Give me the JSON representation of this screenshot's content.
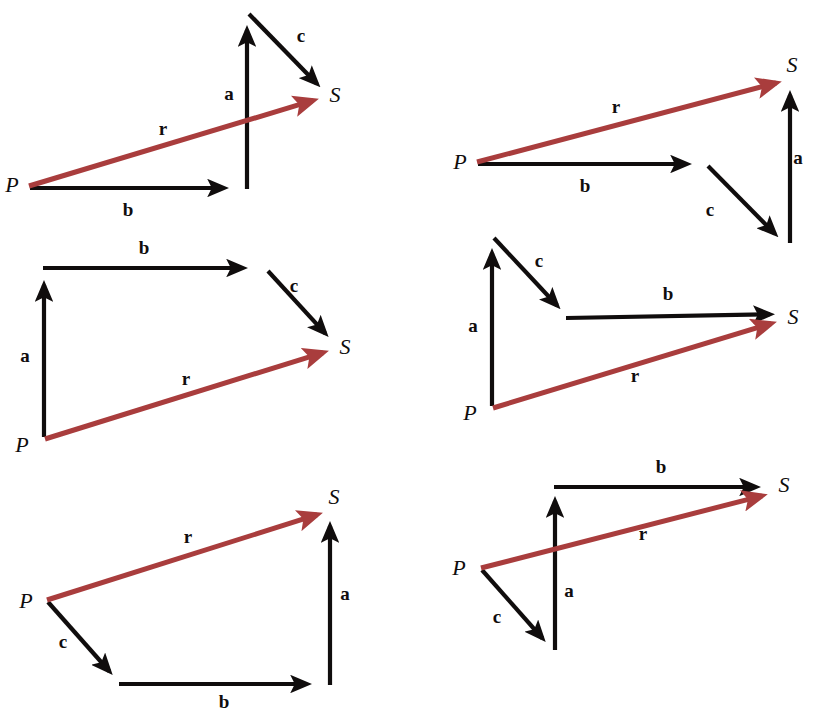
{
  "figure": {
    "width": 814,
    "height": 713,
    "background_color": "#ffffff",
    "component_vector_color": "#100d0d",
    "resultant_vector_color": "#a93d3d",
    "labels": {
      "a": "a",
      "b": "b",
      "c": "c",
      "r": "r",
      "P": "P",
      "S": "S"
    }
  },
  "panels": [
    {
      "id": "panel-1",
      "order": "b, a, c",
      "origin_label": "P",
      "terminus_label": "S",
      "resultant_label": "r",
      "arrows": [
        {
          "name": "vector-b",
          "label": "b",
          "color": "#100d0d",
          "x1": 30,
          "y1": 188,
          "x2": 237,
          "y2": 188,
          "label_x": 128,
          "label_y": 216
        },
        {
          "name": "vector-a",
          "label": "a",
          "color": "#100d0d",
          "x1": 247,
          "y1": 189,
          "x2": 247,
          "y2": 17,
          "label_x": 229,
          "label_y": 100
        },
        {
          "name": "vector-c",
          "label": "c",
          "color": "#100d0d",
          "x1": 249,
          "y1": 14,
          "x2": 326,
          "y2": 93,
          "label_x": 301,
          "label_y": 42
        },
        {
          "name": "vector-r",
          "label": "r",
          "color": "#a93d3d",
          "x1": 29,
          "y1": 186,
          "x2": 328,
          "y2": 96,
          "label_x": 163,
          "label_y": 135
        }
      ],
      "points": [
        {
          "name": "point-p",
          "label": "P",
          "x": 12,
          "y": 192
        },
        {
          "name": "point-s",
          "label": "S",
          "x": 335,
          "y": 102
        }
      ]
    },
    {
      "id": "panel-2",
      "order": "b, c, a",
      "origin_label": "P",
      "terminus_label": "S",
      "resultant_label": "r",
      "arrows": [
        {
          "name": "vector-b",
          "label": "b",
          "color": "#100d0d",
          "x1": 478,
          "y1": 164,
          "x2": 700,
          "y2": 164,
          "label_x": 585,
          "label_y": 192
        },
        {
          "name": "vector-c",
          "label": "c",
          "color": "#100d0d",
          "x1": 708,
          "y1": 166,
          "x2": 784,
          "y2": 243,
          "label_x": 710,
          "label_y": 216
        },
        {
          "name": "vector-a",
          "label": "a",
          "color": "#100d0d",
          "x1": 790,
          "y1": 243,
          "x2": 790,
          "y2": 82,
          "label_x": 798,
          "label_y": 164
        },
        {
          "name": "vector-r",
          "label": "r",
          "color": "#a93d3d",
          "x1": 477,
          "y1": 162,
          "x2": 791,
          "y2": 79,
          "label_x": 616,
          "label_y": 113
        }
      ],
      "points": [
        {
          "name": "point-p",
          "label": "P",
          "x": 460,
          "y": 169
        },
        {
          "name": "point-s",
          "label": "S",
          "x": 792,
          "y": 72
        }
      ]
    },
    {
      "id": "panel-3",
      "order": "a, b, c",
      "origin_label": "P",
      "terminus_label": "S",
      "resultant_label": "r",
      "arrows": [
        {
          "name": "vector-a",
          "label": "a",
          "color": "#100d0d",
          "x1": 44,
          "y1": 437,
          "x2": 44,
          "y2": 272,
          "label_x": 25,
          "label_y": 362
        },
        {
          "name": "vector-b",
          "label": "b",
          "color": "#100d0d",
          "x1": 43,
          "y1": 268,
          "x2": 256,
          "y2": 268,
          "label_x": 144,
          "label_y": 254
        },
        {
          "name": "vector-c",
          "label": "c",
          "color": "#100d0d",
          "x1": 268,
          "y1": 271,
          "x2": 334,
          "y2": 343,
          "label_x": 294,
          "label_y": 292
        },
        {
          "name": "vector-r",
          "label": "r",
          "color": "#a93d3d",
          "x1": 45,
          "y1": 439,
          "x2": 338,
          "y2": 348,
          "label_x": 186,
          "label_y": 385
        }
      ],
      "points": [
        {
          "name": "point-p",
          "label": "P",
          "x": 22,
          "y": 452
        },
        {
          "name": "point-s",
          "label": "S",
          "x": 345,
          "y": 354
        }
      ]
    },
    {
      "id": "panel-4",
      "order": "a, c, b",
      "origin_label": "P",
      "terminus_label": "S",
      "resultant_label": "r",
      "arrows": [
        {
          "name": "vector-a",
          "label": "a",
          "color": "#100d0d",
          "x1": 492,
          "y1": 406,
          "x2": 492,
          "y2": 240,
          "label_x": 473,
          "label_y": 332
        },
        {
          "name": "vector-c",
          "label": "c",
          "color": "#100d0d",
          "x1": 494,
          "y1": 238,
          "x2": 566,
          "y2": 315,
          "label_x": 539,
          "label_y": 267
        },
        {
          "name": "vector-b",
          "label": "b",
          "color": "#100d0d",
          "x1": 566,
          "y1": 318,
          "x2": 783,
          "y2": 314,
          "label_x": 668,
          "label_y": 300
        },
        {
          "name": "vector-r",
          "label": "r",
          "color": "#a93d3d",
          "x1": 493,
          "y1": 408,
          "x2": 786,
          "y2": 319,
          "label_x": 635,
          "label_y": 382
        }
      ],
      "points": [
        {
          "name": "point-p",
          "label": "P",
          "x": 470,
          "y": 420
        },
        {
          "name": "point-s",
          "label": "S",
          "x": 793,
          "y": 324
        }
      ]
    },
    {
      "id": "panel-5",
      "order": "c, b, a",
      "origin_label": "P",
      "terminus_label": "S",
      "resultant_label": "r",
      "arrows": [
        {
          "name": "vector-c",
          "label": "c",
          "color": "#100d0d",
          "x1": 48,
          "y1": 602,
          "x2": 118,
          "y2": 681,
          "label_x": 63,
          "label_y": 648
        },
        {
          "name": "vector-b",
          "label": "b",
          "color": "#100d0d",
          "x1": 119,
          "y1": 684,
          "x2": 320,
          "y2": 684,
          "label_x": 224,
          "label_y": 708
        },
        {
          "name": "vector-a",
          "label": "a",
          "color": "#100d0d",
          "x1": 330,
          "y1": 685,
          "x2": 330,
          "y2": 513,
          "label_x": 345,
          "label_y": 600
        },
        {
          "name": "vector-r",
          "label": "r",
          "color": "#a93d3d",
          "x1": 47,
          "y1": 600,
          "x2": 332,
          "y2": 510,
          "label_x": 188,
          "label_y": 543
        }
      ],
      "points": [
        {
          "name": "point-p",
          "label": "P",
          "x": 26,
          "y": 608
        },
        {
          "name": "point-s",
          "label": "S",
          "x": 334,
          "y": 504
        }
      ]
    },
    {
      "id": "panel-6",
      "order": "c, a, b",
      "origin_label": "P",
      "terminus_label": "S",
      "resultant_label": "r",
      "arrows": [
        {
          "name": "vector-c",
          "label": "c",
          "color": "#100d0d",
          "x1": 482,
          "y1": 570,
          "x2": 551,
          "y2": 648,
          "label_x": 497,
          "label_y": 623
        },
        {
          "name": "vector-a",
          "label": "a",
          "color": "#100d0d",
          "x1": 555,
          "y1": 650,
          "x2": 555,
          "y2": 488,
          "label_x": 569,
          "label_y": 597
        },
        {
          "name": "vector-b",
          "label": "b",
          "color": "#100d0d",
          "x1": 554,
          "y1": 487,
          "x2": 769,
          "y2": 487,
          "label_x": 661,
          "label_y": 473
        },
        {
          "name": "vector-r",
          "label": "r",
          "color": "#a93d3d",
          "x1": 481,
          "y1": 568,
          "x2": 777,
          "y2": 492,
          "label_x": 643,
          "label_y": 540
        }
      ],
      "points": [
        {
          "name": "point-p",
          "label": "P",
          "x": 459,
          "y": 575
        },
        {
          "name": "point-s",
          "label": "S",
          "x": 784,
          "y": 492
        }
      ]
    }
  ]
}
